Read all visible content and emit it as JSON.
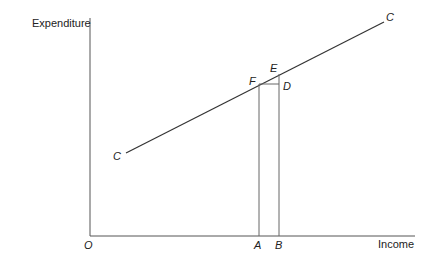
{
  "axes": {
    "y_label": "Expenditure",
    "x_label": "Income",
    "origin_label": "O"
  },
  "curve": {
    "label_start": "C",
    "label_end": "C"
  },
  "points": {
    "F": "F",
    "E": "E",
    "D": "D",
    "A": "A",
    "B": "B"
  },
  "colors": {
    "line": "#333333",
    "axis": "#555555"
  }
}
